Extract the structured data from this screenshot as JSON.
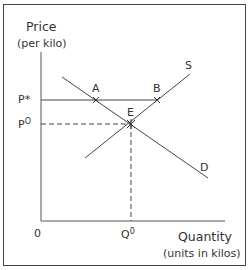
{
  "diagram": {
    "y_axis": {
      "title": "Price",
      "subtitle": "(per kilo)"
    },
    "x_axis": {
      "title": "Quantity",
      "subtitle": "(units in kilos)"
    },
    "origin_label": "0",
    "price_labels": {
      "p_star": "P*",
      "p_zero_base": "P",
      "p_zero_sup": "O"
    },
    "quantity_labels": {
      "q_zero_base": "Q",
      "q_zero_sup": "0"
    },
    "curves": {
      "supply": "S",
      "demand": "D"
    },
    "points": {
      "a": "A",
      "b": "B",
      "e": "E"
    },
    "colors": {
      "line": "#444444",
      "text": "#333333",
      "background": "#ffffff"
    }
  }
}
